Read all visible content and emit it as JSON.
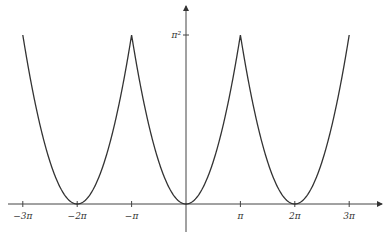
{
  "chart_data": {
    "type": "line",
    "title": "",
    "xlabel": "",
    "ylabel": "",
    "function": "periodic extension of x^2 on [-pi, pi], period 2pi",
    "series": [
      {
        "name": "f(x)",
        "x": [
          -9.4248,
          -6.2832,
          -3.1416,
          0,
          3.1416,
          6.2832,
          9.4248
        ],
        "values": [
          9.8696,
          0,
          9.8696,
          0,
          9.8696,
          0,
          9.8696
        ]
      }
    ],
    "x_ticks": [
      "−3π",
      "−2π",
      "−π",
      "π",
      "2π",
      "3π"
    ],
    "y_ticks": [
      "π²"
    ],
    "xlim": [
      -9.9,
      11.1
    ],
    "ylim": [
      -2.3,
      11.7
    ],
    "grid": false,
    "legend": "none"
  },
  "axes": {
    "x_tick_labels": [
      "−3π",
      "−2π",
      "−π",
      "π",
      "2π",
      "3π"
    ],
    "y_tick_label": "π²"
  }
}
